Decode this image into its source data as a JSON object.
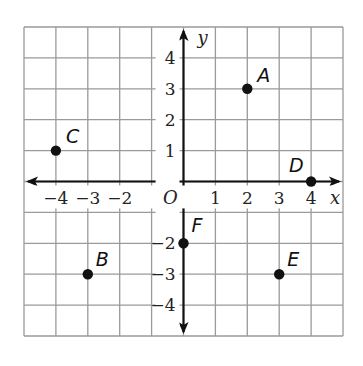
{
  "chart_data": {
    "type": "scatter",
    "title": "",
    "xlabel": "x",
    "ylabel": "y",
    "origin_label": "O",
    "xlim": [
      -5,
      5
    ],
    "ylim": [
      -5,
      5
    ],
    "grid": true,
    "x_tick_labels": [
      "−4",
      "−3",
      "−2",
      "1",
      "2",
      "3",
      "4"
    ],
    "y_tick_labels": [
      "4",
      "3",
      "2",
      "1",
      "−2",
      "−3",
      "−4"
    ],
    "points": [
      {
        "label": "A",
        "x": 2,
        "y": 3
      },
      {
        "label": "B",
        "x": -3,
        "y": -3
      },
      {
        "label": "C",
        "x": -4,
        "y": 1
      },
      {
        "label": "D",
        "x": 4,
        "y": 0
      },
      {
        "label": "E",
        "x": 3,
        "y": -3
      },
      {
        "label": "F",
        "x": 0,
        "y": -2
      }
    ],
    "colors": {
      "grid": "#9a9a9a",
      "axis": "#111111",
      "point": "#111111"
    }
  }
}
